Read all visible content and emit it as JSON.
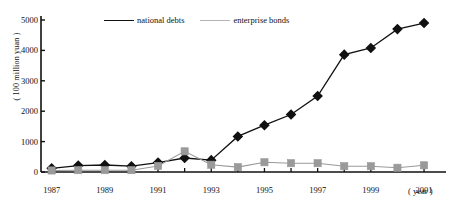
{
  "chart_data": {
    "type": "line",
    "title": "",
    "xlabel": "( year )",
    "ylabel": "( 100 million yuan )",
    "x": [
      1987,
      1988,
      1989,
      1990,
      1991,
      1992,
      1993,
      1994,
      1995,
      1996,
      1997,
      1998,
      1999,
      2000,
      2001
    ],
    "xlim": [
      1986.6,
      2001.6
    ],
    "ylim": [
      0,
      5000
    ],
    "grid": false,
    "legend_position": "top-center",
    "xtick_labels": [
      "1987",
      "1989",
      "1991",
      "1993",
      "1995",
      "1997",
      "1999",
      "2001"
    ],
    "xtick_values": [
      1987,
      1989,
      1991,
      1993,
      1995,
      1997,
      1999,
      2001
    ],
    "ytick_labels": [
      "0",
      "1000",
      "2000",
      "3000",
      "4000",
      "5000"
    ],
    "ytick_values": [
      0,
      1000,
      2000,
      3000,
      4000,
      5000
    ],
    "series": [
      {
        "name": "national debts",
        "color": "#111111",
        "marker": "diamond",
        "values": [
          120,
          210,
          230,
          190,
          310,
          460,
          390,
          1170,
          1540,
          1890,
          2500,
          3860,
          4080,
          4700,
          4900
        ]
      },
      {
        "name": "enterprise bonds",
        "color": "#9a9a9a",
        "marker": "square",
        "values": [
          50,
          60,
          60,
          60,
          200,
          680,
          240,
          160,
          320,
          290,
          290,
          190,
          190,
          140,
          220
        ]
      }
    ]
  },
  "legend": {
    "items": [
      {
        "label": "national debts",
        "color": "#111111",
        "marker": "diamond"
      },
      {
        "label": "enterprise bonds",
        "color": "#9a9a9a",
        "marker": "square"
      }
    ]
  },
  "axes": {
    "y_title": "( 100 million yuan )",
    "x_unit": "( year )"
  }
}
